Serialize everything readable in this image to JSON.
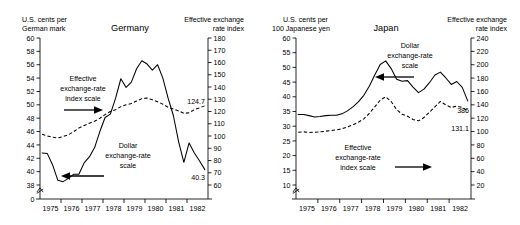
{
  "figure": {
    "panels": [
      {
        "id": "germany",
        "title": "Germany",
        "left_axis_title_line1": "U.S. cents per",
        "left_axis_title_line2": "German mark",
        "right_axis_title_line1": "Effective exchange",
        "right_axis_title_line2": "rate index",
        "annotation_index_l1": "Effective",
        "annotation_index_l2": "exchange-rate",
        "annotation_index_l3": "index scale",
        "annotation_dollar_l1": "Dollar",
        "annotation_dollar_l2": "exchange-rate",
        "annotation_dollar_l3": "scale",
        "end_value_index": "124.7",
        "end_value_dollar": "40.3",
        "zero_label": "0"
      },
      {
        "id": "japan",
        "title": "Japan",
        "left_axis_title_line1": "U.S. cents per",
        "left_axis_title_line2": "100  Japanese yen",
        "right_axis_title_line1": "Effective exchange",
        "right_axis_title_line2": "rate index",
        "annotation_dollar_l1": "Dollar",
        "annotation_dollar_l2": "exchange-rate",
        "annotation_dollar_l3": "scale",
        "annotation_index_l1": "Effective",
        "annotation_index_l2": "exchange-rate",
        "annotation_index_l3": "index scale",
        "end_value_dollar": "386",
        "end_value_index": "131.1"
      }
    ]
  },
  "chart_data": [
    {
      "type": "line",
      "title": "Germany",
      "xlabel": "",
      "ylabel": "U.S. cents per German mark",
      "y2label": "Effective exchange rate index",
      "xlim": [
        1974.5,
        1982.5
      ],
      "xticks": [
        "1975",
        "1976",
        "1977",
        "1978",
        "1979",
        "1980",
        "1981",
        "1982"
      ],
      "ylim": [
        38,
        60
      ],
      "yticks": [
        38,
        40,
        42,
        44,
        46,
        48,
        50,
        52,
        54,
        56,
        58,
        60
      ],
      "y_axis_break": true,
      "y_break_label": "0",
      "y2lim": [
        60,
        180
      ],
      "y2ticks": [
        60,
        70,
        80,
        90,
        100,
        110,
        120,
        130,
        140,
        150,
        160,
        170,
        180
      ],
      "grid": false,
      "legend": "annotations",
      "series": [
        {
          "name": "Dollar exchange-rate scale",
          "style": "solid",
          "axis": "left",
          "units": "U.S. cents per German mark",
          "end_label": "40.3",
          "x": [
            1974.6,
            1974.85,
            1975.1,
            1975.35,
            1975.6,
            1975.85,
            1976.1,
            1976.35,
            1976.6,
            1976.85,
            1977.1,
            1977.35,
            1977.6,
            1977.85,
            1978.1,
            1978.35,
            1978.6,
            1978.85,
            1979.1,
            1979.35,
            1979.6,
            1979.85,
            1980.1,
            1980.35,
            1980.6,
            1980.85,
            1981.1,
            1981.35,
            1981.6,
            1981.85,
            1982.1,
            1982.35
          ],
          "y": [
            42.8,
            42.7,
            41.0,
            38.7,
            38.5,
            39.0,
            39.6,
            39.6,
            41.3,
            42.2,
            43.6,
            46.0,
            48.1,
            48.6,
            51.0,
            53.9,
            52.6,
            53.4,
            55.4,
            56.6,
            56.1,
            55.2,
            56.0,
            54.0,
            51.0,
            48.4,
            44.5,
            41.4,
            44.3,
            42.8,
            41.6,
            40.3
          ]
        },
        {
          "name": "Effective exchange-rate index scale",
          "style": "dashed",
          "axis": "right",
          "units": "index",
          "end_label": "124.7",
          "x": [
            1974.6,
            1974.85,
            1975.1,
            1975.35,
            1975.6,
            1975.85,
            1976.1,
            1976.35,
            1976.6,
            1976.85,
            1977.1,
            1977.35,
            1977.6,
            1977.85,
            1978.1,
            1978.35,
            1978.6,
            1978.85,
            1979.1,
            1979.35,
            1979.6,
            1979.85,
            1980.1,
            1980.35,
            1980.6,
            1980.85,
            1981.1,
            1981.35,
            1981.6,
            1981.85,
            1982.1,
            1982.35
          ],
          "y": [
            101.5,
            100.0,
            99.0,
            98.5,
            99.5,
            101.0,
            103.5,
            106.5,
            108.5,
            110.5,
            112.0,
            114.5,
            117.5,
            120.0,
            121.5,
            124.0,
            125.5,
            126.5,
            128.5,
            130.5,
            131.0,
            129.5,
            128.0,
            126.0,
            123.5,
            122.0,
            120.5,
            118.5,
            119.0,
            121.5,
            123.0,
            124.7
          ]
        }
      ]
    },
    {
      "type": "line",
      "title": "Japan",
      "xlabel": "",
      "ylabel": "U.S. cents per 100 Japanese yen",
      "y2label": "Effective exchange rate index",
      "xlim": [
        1974.5,
        1982.5
      ],
      "xticks": [
        "1975",
        "1976",
        "1977",
        "1978",
        "1979",
        "1980",
        "1981",
        "1982"
      ],
      "ylim": [
        10,
        60
      ],
      "yticks": [
        10,
        15,
        20,
        25,
        30,
        35,
        40,
        45,
        50,
        55,
        60
      ],
      "y_axis_break": true,
      "y2lim": [
        20,
        240
      ],
      "y2ticks": [
        20,
        40,
        60,
        80,
        100,
        120,
        140,
        160,
        180,
        200,
        220,
        240
      ],
      "grid": false,
      "legend": "annotations",
      "series": [
        {
          "name": "Dollar exchange-rate scale",
          "style": "solid",
          "axis": "left",
          "units": "U.S. cents per 100 Japanese yen",
          "end_label": "386",
          "x": [
            1974.6,
            1974.85,
            1975.1,
            1975.35,
            1975.6,
            1975.85,
            1976.1,
            1976.35,
            1976.6,
            1976.85,
            1977.1,
            1977.35,
            1977.6,
            1977.85,
            1978.1,
            1978.35,
            1978.6,
            1978.85,
            1979.1,
            1979.35,
            1979.6,
            1979.85,
            1980.1,
            1980.35,
            1980.6,
            1980.85,
            1981.1,
            1981.35,
            1981.6,
            1981.85,
            1982.1,
            1982.35
          ],
          "y": [
            34.0,
            34.0,
            33.6,
            33.1,
            33.3,
            33.6,
            33.7,
            33.7,
            34.2,
            35.2,
            36.6,
            38.3,
            40.5,
            43.6,
            47.4,
            51.0,
            52.2,
            49.6,
            46.0,
            45.3,
            45.5,
            43.3,
            41.4,
            42.6,
            44.8,
            47.4,
            48.4,
            46.4,
            44.2,
            45.2,
            43.2,
            38.6
          ]
        },
        {
          "name": "Effective exchange-rate index scale",
          "style": "dashed",
          "axis": "right",
          "units": "index",
          "end_label": "131.1",
          "x": [
            1974.6,
            1974.85,
            1975.1,
            1975.35,
            1975.6,
            1975.85,
            1976.1,
            1976.35,
            1976.6,
            1976.85,
            1977.1,
            1977.35,
            1977.6,
            1977.85,
            1978.1,
            1978.35,
            1978.6,
            1978.85,
            1979.1,
            1979.35,
            1979.6,
            1979.85,
            1980.1,
            1980.35,
            1980.6,
            1980.85,
            1981.1,
            1981.35,
            1981.6,
            1981.85,
            1982.1,
            1982.35
          ],
          "y": [
            99.0,
            99.5,
            98.5,
            99.0,
            99.5,
            100.5,
            101.5,
            102.5,
            104.0,
            107.0,
            110.0,
            114.0,
            119.0,
            127.0,
            137.0,
            147.0,
            152.0,
            145.0,
            133.0,
            126.0,
            123.0,
            118.0,
            116.0,
            121.0,
            129.0,
            137.0,
            145.0,
            140.0,
            136.0,
            138.0,
            136.0,
            131.1
          ]
        }
      ]
    }
  ]
}
